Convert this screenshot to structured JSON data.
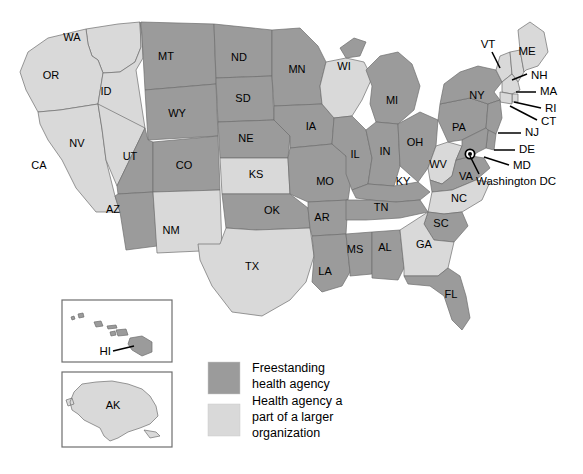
{
  "map": {
    "title": "US State Health Agency Structure Map",
    "background_color": "#ffffff",
    "colors": {
      "freestanding": "#9b9b9b",
      "part_of_larger": "#d9d9d9",
      "border": "#6e6e6e",
      "label": "#000000"
    },
    "marker": {
      "name": "washington-dc-marker",
      "label": "Washington DC",
      "x": 470,
      "y": 154
    }
  },
  "legend": {
    "items": [
      {
        "label_line1": "Freestanding",
        "label_line2": "health agency",
        "label_line3": "",
        "color_key": "freestanding",
        "color": "#9b9b9b"
      },
      {
        "label_line1": "Health agency a",
        "label_line2": "part of a larger",
        "label_line3": "organization",
        "color_key": "part_of_larger",
        "color": "#d9d9d9"
      }
    ]
  },
  "insets": [
    {
      "name": "hawaii-inset",
      "label": "HI",
      "category": "freestanding"
    },
    {
      "name": "alaska-inset",
      "label": "AK",
      "category": "part_of_larger"
    }
  ],
  "states": [
    {
      "code": "WA",
      "category": "part_of_larger",
      "lx": 72,
      "ly": 38
    },
    {
      "code": "OR",
      "category": "part_of_larger",
      "lx": 51,
      "ly": 76
    },
    {
      "code": "ID",
      "category": "part_of_larger",
      "lx": 106,
      "ly": 92
    },
    {
      "code": "CA",
      "category": "part_of_larger",
      "lx": 39,
      "ly": 166
    },
    {
      "code": "NV",
      "category": "part_of_larger",
      "lx": 77,
      "ly": 144
    },
    {
      "code": "MT",
      "category": "freestanding",
      "lx": 166,
      "ly": 57
    },
    {
      "code": "WY",
      "category": "freestanding",
      "lx": 177,
      "ly": 114
    },
    {
      "code": "UT",
      "category": "freestanding",
      "lx": 130,
      "ly": 157
    },
    {
      "code": "AZ",
      "category": "freestanding",
      "lx": 113,
      "ly": 210
    },
    {
      "code": "CO",
      "category": "freestanding",
      "lx": 184,
      "ly": 166
    },
    {
      "code": "NM",
      "category": "part_of_larger",
      "lx": 171,
      "ly": 231
    },
    {
      "code": "ND",
      "category": "freestanding",
      "lx": 239,
      "ly": 58
    },
    {
      "code": "SD",
      "category": "freestanding",
      "lx": 243,
      "ly": 99
    },
    {
      "code": "NE",
      "category": "freestanding",
      "lx": 246,
      "ly": 139
    },
    {
      "code": "KS",
      "category": "part_of_larger",
      "lx": 256,
      "ly": 175
    },
    {
      "code": "OK",
      "category": "freestanding",
      "lx": 272,
      "ly": 211
    },
    {
      "code": "TX",
      "category": "part_of_larger",
      "lx": 252,
      "ly": 267
    },
    {
      "code": "MN",
      "category": "freestanding",
      "lx": 297,
      "ly": 70
    },
    {
      "code": "IA",
      "category": "freestanding",
      "lx": 311,
      "ly": 127
    },
    {
      "code": "MO",
      "category": "freestanding",
      "lx": 325,
      "ly": 182
    },
    {
      "code": "AR",
      "category": "freestanding",
      "lx": 322,
      "ly": 218
    },
    {
      "code": "LA",
      "category": "freestanding",
      "lx": 325,
      "ly": 272
    },
    {
      "code": "WI",
      "category": "part_of_larger",
      "lx": 344,
      "ly": 67
    },
    {
      "code": "IL",
      "category": "freestanding",
      "lx": 355,
      "ly": 155
    },
    {
      "code": "MS",
      "category": "freestanding",
      "lx": 355,
      "ly": 250
    },
    {
      "code": "MI",
      "category": "freestanding",
      "lx": 392,
      "ly": 101
    },
    {
      "code": "IN",
      "category": "freestanding",
      "lx": 385,
      "ly": 152
    },
    {
      "code": "KY",
      "category": "freestanding",
      "lx": 403,
      "ly": 182
    },
    {
      "code": "TN",
      "category": "freestanding",
      "lx": 381,
      "ly": 208
    },
    {
      "code": "AL",
      "category": "freestanding",
      "lx": 385,
      "ly": 248
    },
    {
      "code": "OH",
      "category": "freestanding",
      "lx": 415,
      "ly": 143
    },
    {
      "code": "WV",
      "category": "part_of_larger",
      "lx": 438,
      "ly": 165
    },
    {
      "code": "GA",
      "category": "part_of_larger",
      "lx": 424,
      "ly": 245
    },
    {
      "code": "SC",
      "category": "freestanding",
      "lx": 441,
      "ly": 224
    },
    {
      "code": "NC",
      "category": "part_of_larger",
      "lx": 459,
      "ly": 199
    },
    {
      "code": "FL",
      "category": "freestanding",
      "lx": 451,
      "ly": 295
    },
    {
      "code": "VA",
      "category": "freestanding",
      "lx": 466,
      "ly": 177
    },
    {
      "code": "PA",
      "category": "freestanding",
      "lx": 459,
      "ly": 128
    },
    {
      "code": "NY",
      "category": "freestanding",
      "lx": 477,
      "ly": 96
    }
  ],
  "callouts": [
    {
      "code": "VT",
      "category": "part_of_larger",
      "tx": 488,
      "ty": 45,
      "anchor": "middle",
      "lx1": 492,
      "ly1": 52,
      "lx2": 500,
      "ly2": 68
    },
    {
      "code": "ME",
      "category": "part_of_larger",
      "tx": 527,
      "ty": 52,
      "anchor": "middle",
      "lx1": 0,
      "ly1": 0,
      "lx2": 0,
      "ly2": 0
    },
    {
      "code": "NH",
      "category": "part_of_larger",
      "tx": 531,
      "ty": 76,
      "anchor": "start",
      "lx1": 512,
      "ly1": 80,
      "lx2": 527,
      "ly2": 74
    },
    {
      "code": "MA",
      "category": "part_of_larger",
      "tx": 540,
      "ty": 92,
      "anchor": "start",
      "lx1": 516,
      "ly1": 92,
      "lx2": 536,
      "ly2": 92
    },
    {
      "code": "RI",
      "category": "part_of_larger",
      "tx": 545,
      "ty": 109,
      "anchor": "start",
      "lx1": 514,
      "ly1": 102,
      "lx2": 541,
      "ly2": 108
    },
    {
      "code": "CT",
      "category": "part_of_larger",
      "tx": 541,
      "ty": 122,
      "anchor": "start",
      "lx1": 510,
      "ly1": 106,
      "lx2": 537,
      "ly2": 120
    },
    {
      "code": "NJ",
      "category": "freestanding",
      "tx": 525,
      "ty": 133,
      "anchor": "start",
      "lx1": 498,
      "ly1": 133,
      "lx2": 521,
      "ly2": 133
    },
    {
      "code": "DE",
      "category": "freestanding",
      "tx": 519,
      "ty": 150,
      "anchor": "start",
      "lx1": 494,
      "ly1": 150,
      "lx2": 515,
      "ly2": 150
    },
    {
      "code": "MD",
      "category": "freestanding",
      "tx": 513,
      "ty": 166,
      "anchor": "start",
      "lx1": 484,
      "ly1": 157,
      "lx2": 509,
      "ly2": 165
    },
    {
      "code": "Washington DC",
      "category": "freestanding",
      "tx": 476,
      "ty": 182,
      "anchor": "start",
      "lx1": 470,
      "ly1": 156,
      "lx2": 479,
      "ly2": 174
    }
  ]
}
